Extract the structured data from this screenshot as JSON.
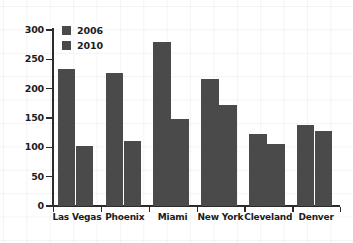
{
  "chart_data": {
    "type": "bar",
    "title": "",
    "xlabel": "",
    "ylabel": "",
    "ylim": [
      0,
      300
    ],
    "yticks": [
      0,
      50,
      100,
      150,
      200,
      250,
      300
    ],
    "ytick_labels": [
      "0",
      "50",
      "100",
      "150",
      "200",
      "250",
      "300"
    ],
    "grid": true,
    "legend_position": "upper-left-inside",
    "categories": [
      "Las Vegas",
      "Phoenix",
      "Miami",
      "New York",
      "Cleveland",
      "Denver"
    ],
    "series": [
      {
        "name": "2006",
        "color": "#4a4a4a",
        "values": [
          233,
          227,
          280,
          216,
          122,
          138
        ]
      },
      {
        "name": "2010",
        "color": "#4a4a4a",
        "values": [
          103,
          111,
          148,
          172,
          106,
          128
        ]
      }
    ]
  },
  "legend": {
    "entries": [
      {
        "label": "2006",
        "swatch_name": "legend-swatch-2006"
      },
      {
        "label": "2010",
        "swatch_name": "legend-swatch-2010"
      }
    ]
  },
  "colors": {
    "bar": "#4a4a4a",
    "axis": "#2b2b2b",
    "text": "#1c1c1c",
    "background": "#ffffff",
    "grid": "rgba(0,0,0,0.045)"
  }
}
